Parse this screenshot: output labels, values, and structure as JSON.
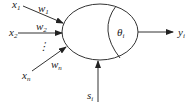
{
  "diagram": {
    "type": "neuron-model",
    "inputs": [
      {
        "label": "x",
        "sub": "1",
        "weight_label": "w",
        "weight_sub": "1"
      },
      {
        "label": "x",
        "sub": "2",
        "weight_label": "w",
        "weight_sub": "2"
      },
      {
        "label": "x",
        "sub": "n",
        "weight_label": "w",
        "weight_sub": "n"
      }
    ],
    "ellipsis": "⋮",
    "threshold": {
      "label": "θ",
      "sub": "i"
    },
    "output": {
      "label": "y",
      "sub": "i"
    },
    "external_input": {
      "label": "s",
      "sub": "i"
    },
    "colors": {
      "stroke": "#333333",
      "text": "#222222",
      "background": "#ffffff"
    }
  }
}
